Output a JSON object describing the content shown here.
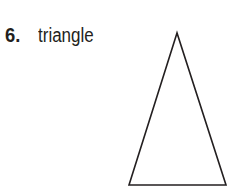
{
  "problem": {
    "number": "6.",
    "label": "triangle"
  },
  "figure": {
    "shape": "triangle-icon",
    "type": "isosceles triangle",
    "stroke_color": "#231f20",
    "points": [
      [
        177,
        33
      ],
      [
        129,
        185
      ],
      [
        226,
        185
      ]
    ]
  }
}
